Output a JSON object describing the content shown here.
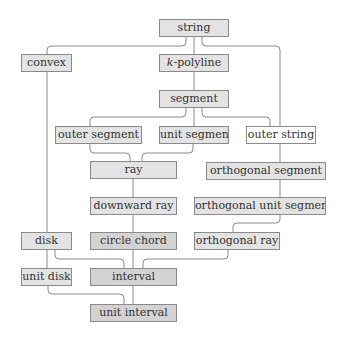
{
  "diagram": {
    "title": "",
    "colors": {
      "light_fill": "#e3e3e3",
      "dark_fill": "#d3d3d3",
      "white_fill": "#ffffff",
      "border": "#8a8a8a",
      "edge": "#8a8a8a"
    },
    "nodes": {
      "string": {
        "label": "string"
      },
      "k_polyline": {
        "label_prefix": "k",
        "label_suffix": "-polyline"
      },
      "convex": {
        "label": "convex"
      },
      "segment": {
        "label": "segment"
      },
      "outer_segment": {
        "label": "outer segment"
      },
      "unit_segment": {
        "label": "unit segment"
      },
      "outer_string": {
        "label": "outer string"
      },
      "ray": {
        "label": "ray"
      },
      "orthogonal_segment": {
        "label": "orthogonal segment"
      },
      "downward_ray": {
        "label": "downward ray"
      },
      "orthogonal_unit_segment": {
        "label": "orthogonal unit segment"
      },
      "disk": {
        "label": "disk"
      },
      "circle_chord": {
        "label": "circle chord"
      },
      "orthogonal_ray": {
        "label": "orthogonal ray"
      },
      "unit_disk": {
        "label": "unit disk"
      },
      "interval": {
        "label": "interval"
      },
      "unit_interval": {
        "label": "unit interval"
      }
    },
    "edges": [
      [
        "string",
        "k-polyline"
      ],
      [
        "string",
        "convex"
      ],
      [
        "string",
        "outer string"
      ],
      [
        "k-polyline",
        "segment"
      ],
      [
        "segment",
        "outer segment"
      ],
      [
        "segment",
        "unit segment"
      ],
      [
        "segment",
        "outer string"
      ],
      [
        "outer segment",
        "ray"
      ],
      [
        "unit segment",
        "ray"
      ],
      [
        "outer string",
        "orthogonal segment"
      ],
      [
        "ray",
        "downward ray"
      ],
      [
        "orthogonal segment",
        "orthogonal unit segment"
      ],
      [
        "downward ray",
        "circle chord"
      ],
      [
        "orthogonal unit segment",
        "orthogonal ray"
      ],
      [
        "convex",
        "disk"
      ],
      [
        "disk",
        "unit disk"
      ],
      [
        "disk",
        "interval"
      ],
      [
        "circle chord",
        "interval"
      ],
      [
        "orthogonal ray",
        "interval"
      ],
      [
        "unit disk",
        "unit interval"
      ],
      [
        "interval",
        "unit interval"
      ]
    ]
  }
}
